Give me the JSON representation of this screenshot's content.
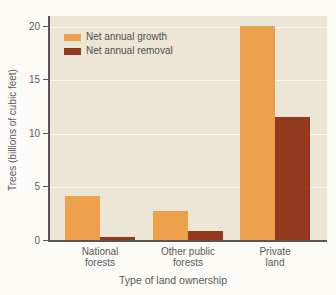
{
  "figure": {
    "background": "#fcfbf5",
    "plot_background": "#ece6d6",
    "axis_color": "#55565a",
    "gridline_color": "#ffffff",
    "text_color": "#58595b"
  },
  "chart_data": {
    "type": "bar",
    "title": "",
    "categories": [
      "National forests",
      "Other public forests",
      "Private land"
    ],
    "categories_two_line": [
      [
        "National",
        "forests"
      ],
      [
        "Other public",
        "forests"
      ],
      [
        "Private",
        "land"
      ]
    ],
    "series": [
      {
        "name": "Net annual growth",
        "color": "#eea14c",
        "values": [
          4.2,
          2.8,
          20.1
        ]
      },
      {
        "name": "Net annual removal",
        "color": "#93391d",
        "values": [
          0.4,
          0.9,
          11.6
        ]
      }
    ],
    "xlabel": "Type of land ownership",
    "ylabel": "Trees (billions of cubic feet)",
    "ylim": [
      0,
      21
    ],
    "yticks": [
      0,
      5,
      10,
      15,
      20
    ],
    "grid": true,
    "legend_position": "top-left"
  }
}
